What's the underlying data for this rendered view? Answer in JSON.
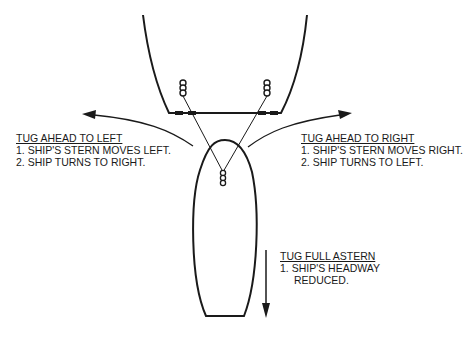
{
  "diagram": {
    "labels": {
      "tug_ahead_left": {
        "title": "TUG AHEAD TO LEFT",
        "lines": [
          "1. SHIP'S STERN MOVES LEFT.",
          "2. SHIP TURNS TO RIGHT."
        ]
      },
      "tug_ahead_right": {
        "title": "TUG AHEAD TO RIGHT",
        "lines": [
          "1. SHIP'S STERN MOVES RIGHT.",
          "2. SHIP TURNS TO LEFT."
        ]
      },
      "tug_full_astern": {
        "title": "TUG FULL ASTERN",
        "lines": [
          "1. SHIP'S HEADWAY",
          "REDUCED."
        ]
      }
    },
    "elements": {
      "ship": "ship-stern-hull",
      "tug": "tug-hull",
      "towlines": 2,
      "bitts": 3,
      "arrows": [
        "curved-arrow-left",
        "curved-arrow-right",
        "straight-arrow-down"
      ]
    },
    "colors": {
      "ink": "#1a1a1a",
      "background": "#ffffff"
    }
  }
}
